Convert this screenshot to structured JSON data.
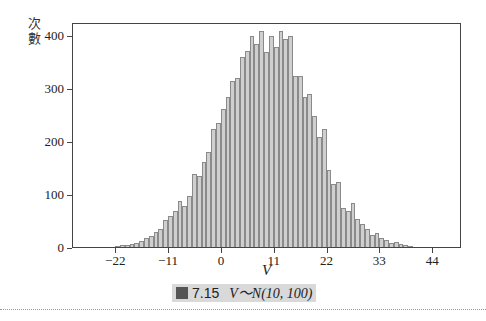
{
  "chart_data": {
    "type": "bar",
    "title": "",
    "xlabel": "V",
    "ylabel": "次數",
    "ylim": [
      0,
      420
    ],
    "xlim": [
      -31,
      50
    ],
    "y_ticks": [
      0,
      100,
      200,
      300,
      400
    ],
    "x_ticks": [
      -22,
      -11,
      0,
      11,
      22,
      33,
      44
    ],
    "bin_width": 1,
    "bin_start": -23,
    "grid": false,
    "legend": null,
    "values": [
      2,
      4,
      5,
      6,
      8,
      10,
      14,
      18,
      22,
      30,
      35,
      52,
      60,
      70,
      88,
      80,
      98,
      140,
      135,
      162,
      182,
      225,
      235,
      262,
      285,
      315,
      320,
      360,
      372,
      400,
      385,
      410,
      370,
      400,
      380,
      410,
      395,
      400,
      325,
      325,
      285,
      290,
      250,
      210,
      225,
      148,
      120,
      125,
      75,
      70,
      85,
      55,
      45,
      35,
      25,
      28,
      18,
      15,
      10,
      12,
      8,
      6,
      3,
      2
    ],
    "caption": {
      "figure_label": "圖",
      "figure_number": "7.15",
      "distribution": "V～N(10, 100)"
    }
  }
}
